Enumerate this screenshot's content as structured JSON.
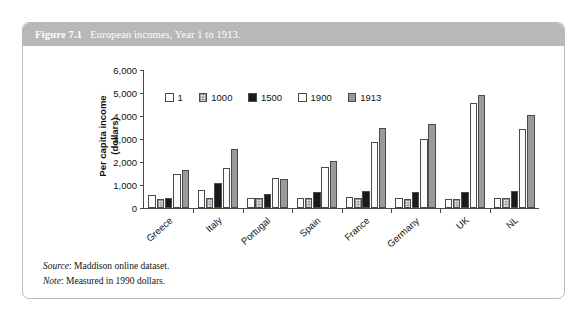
{
  "figure": {
    "label": "Figure 7.1",
    "title": "European incomes, Year 1 to 1913."
  },
  "notes": {
    "source_key": "Source",
    "source_text": ": Maddison online dataset.",
    "note_key": "Note",
    "note_text": ": Measured in 1990 dollars."
  },
  "chart_data": {
    "type": "bar",
    "title": "European incomes, Year 1 to 1913.",
    "xlabel": "",
    "ylabel": "Per capita income\n(dollars)",
    "ylim": [
      0,
      6000
    ],
    "yticks": [
      "0",
      "1,000",
      "2,000",
      "3,000",
      "4,000",
      "5,000",
      "6,000"
    ],
    "ytick_values": [
      0,
      1000,
      2000,
      3000,
      4000,
      5000,
      6000
    ],
    "grid": false,
    "legend_position": "top-left-inside",
    "categories": [
      "Greece",
      "Italy",
      "Portugal",
      "Spain",
      "France",
      "Germany",
      "UK",
      "NL"
    ],
    "series": [
      {
        "name": "1",
        "color": "#ffffff",
        "values": [
          550,
          800,
          450,
          450,
          473,
          425,
          400,
          425
        ]
      },
      {
        "name": "1000",
        "color": "#f2f2f2",
        "values": [
          400,
          450,
          425,
          450,
          425,
          410,
          400,
          425
        ]
      },
      {
        "name": "1500",
        "color": "#1a1a1a",
        "values": [
          433,
          1100,
          600,
          698,
          750,
          700,
          714,
          761
        ]
      },
      {
        "name": "1900",
        "color": "#fbfbfb",
        "values": [
          1500,
          1750,
          1300,
          1786,
          2876,
          3000,
          4550,
          3424
        ]
      },
      {
        "name": "1913",
        "color": "#9a9a9a",
        "values": [
          1650,
          2550,
          1250,
          2056,
          3485,
          3648,
          4921,
          4049
        ]
      }
    ]
  }
}
